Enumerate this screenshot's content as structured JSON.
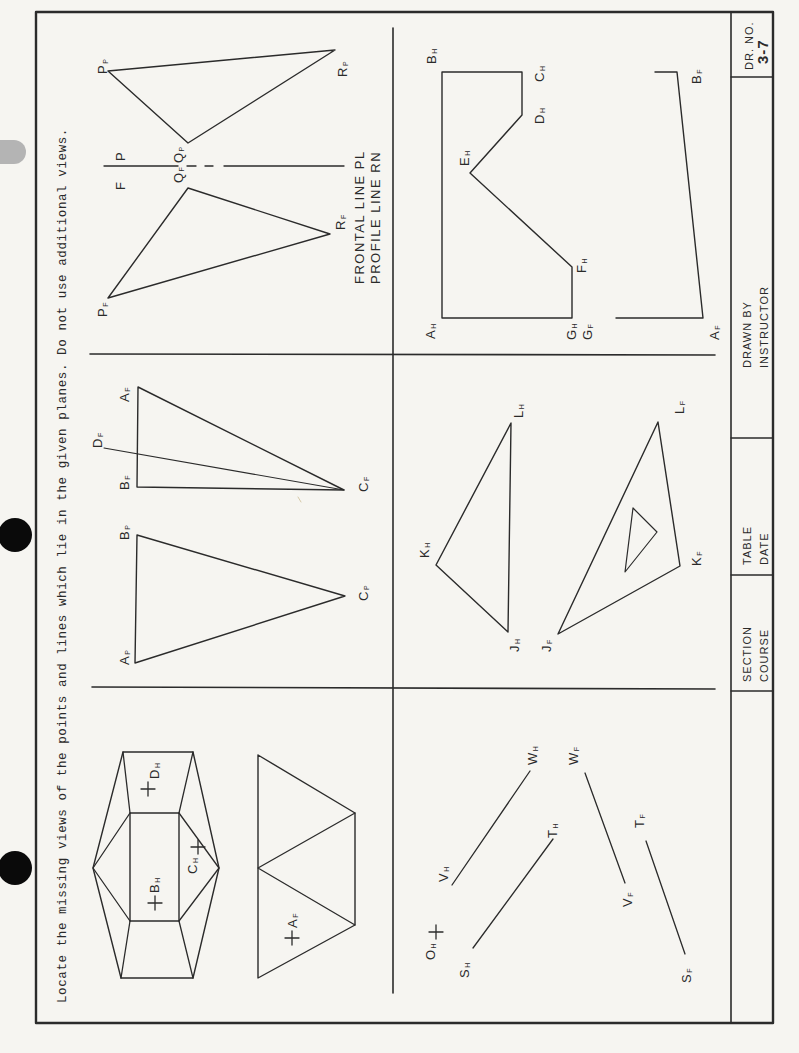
{
  "instruction": "Locate the missing views of the points and lines which lie in the given planes.  Do not use additional views.",
  "title_block": {
    "dr_no_label": "DR. NO.",
    "dr_no_value": "3-7",
    "drawn_by_label": "DRAWN BY",
    "drawn_by_value": "INSTRUCTOR",
    "table_label": "TABLE",
    "date_label": "DATE",
    "section_label": "SECTION",
    "course_label": "COURSE"
  },
  "problems": {
    "pqr": {
      "labels": {
        "Pp": "P",
        "Rp": "R",
        "Qp": "Q",
        "Pf": "P",
        "Qf": "Q",
        "Rf": "R"
      },
      "subs": {
        "p": "P",
        "f": "F"
      },
      "fold_left": "F",
      "fold_right": "P",
      "note_line1": "FRONTAL LINE  PL",
      "note_line2": "PROFILE  LINE  RN"
    },
    "ah_bf": {
      "labels": {
        "A": "A",
        "B": "B",
        "C": "C",
        "D": "D",
        "E": "E",
        "F": "F",
        "G": "G"
      },
      "subs": {
        "h": "H",
        "f": "F"
      }
    },
    "abc": {
      "labels": {
        "A": "A",
        "B": "B",
        "C": "C",
        "D": "D"
      },
      "subs": {
        "f": "F",
        "p": "P"
      }
    },
    "jkl": {
      "labels": {
        "J": "J",
        "K": "K",
        "L": "L"
      },
      "subs": {
        "h": "H",
        "f": "F"
      }
    },
    "solid": {
      "labels": {
        "B": "B",
        "C": "C",
        "D": "D",
        "A": "A"
      },
      "subs": {
        "h": "H",
        "f": "F"
      }
    },
    "lines": {
      "labels": {
        "O": "O",
        "S": "S",
        "T": "T",
        "V": "V",
        "W": "W"
      },
      "subs": {
        "h": "H",
        "f": "F"
      }
    }
  }
}
